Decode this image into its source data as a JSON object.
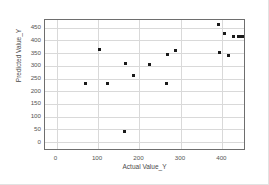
{
  "chart_data": {
    "type": "scatter",
    "title": "",
    "xlabel": "Actual Value_Y",
    "ylabel": "Predicted Value_Y",
    "xlim": [
      -28,
      457
    ],
    "ylim": [
      -35,
      480
    ],
    "xticks": [
      0,
      100,
      200,
      300,
      400
    ],
    "yticks": [
      0,
      50,
      100,
      150,
      200,
      250,
      300,
      350,
      400,
      450
    ],
    "xtick_labels": [
      "0",
      "100",
      "200",
      "300",
      "400"
    ],
    "ytick_labels": [
      "0",
      "50",
      "100",
      "150",
      "200",
      "250",
      "300",
      "350",
      "400",
      "450"
    ],
    "grid": true,
    "grid_color": "#d9d9d9",
    "marker": "square",
    "marker_color": "#1a1a1a",
    "marker_size": 3,
    "legend": null,
    "series": [
      {
        "name": "Predicted vs Actual",
        "points": [
          {
            "x": 70,
            "y": 231
          },
          {
            "x": 103,
            "y": 365
          },
          {
            "x": 124,
            "y": 229
          },
          {
            "x": 165,
            "y": 43
          },
          {
            "x": 166,
            "y": 309
          },
          {
            "x": 186,
            "y": 262
          },
          {
            "x": 224,
            "y": 304
          },
          {
            "x": 266,
            "y": 231
          },
          {
            "x": 268,
            "y": 345
          },
          {
            "x": 288,
            "y": 360
          },
          {
            "x": 390,
            "y": 463
          },
          {
            "x": 392,
            "y": 354
          },
          {
            "x": 404,
            "y": 428
          },
          {
            "x": 414,
            "y": 342
          },
          {
            "x": 428,
            "y": 416
          },
          {
            "x": 440,
            "y": 415
          },
          {
            "x": 445,
            "y": 415
          },
          {
            "x": 450,
            "y": 415
          }
        ]
      }
    ]
  }
}
